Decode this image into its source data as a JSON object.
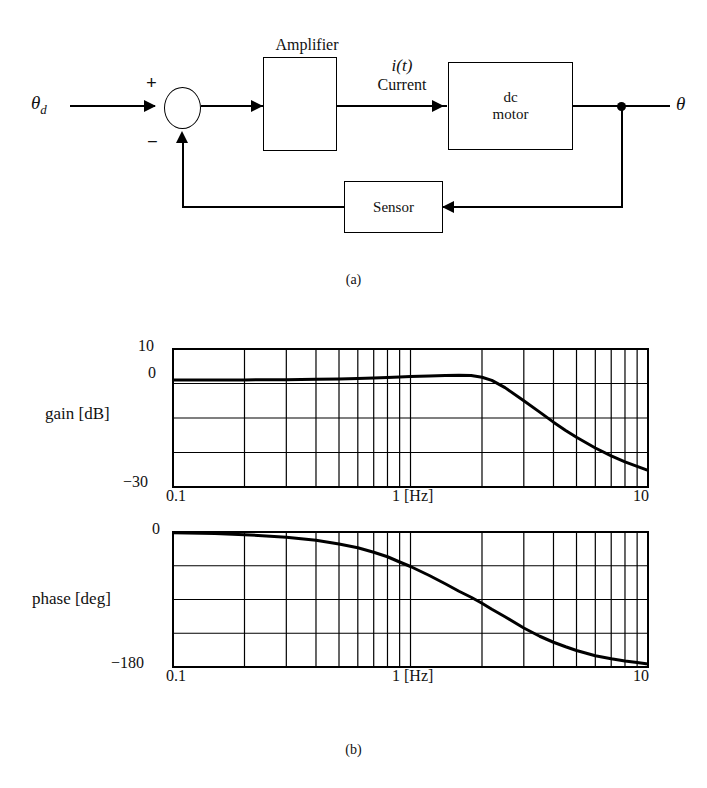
{
  "figure": {
    "part_a_caption": "(a)",
    "part_b_caption": "(b)"
  },
  "block_diagram": {
    "input_label": "θ_d",
    "input_label_base": "θ",
    "input_label_sub": "d",
    "plus_sign": "+",
    "minus_sign": "−",
    "amplifier_title": "Amplifier",
    "amplifier_box_text": "",
    "signal_label_line1": "i(t)",
    "signal_label_line2": "Current",
    "motor_line1": "dc",
    "motor_line2": "motor",
    "sensor_label": "Sensor",
    "output_label": "θ"
  },
  "chart_data": [
    {
      "type": "line",
      "id": "gain-plot",
      "title": "",
      "xlabel": "1 [Hz]",
      "ylabel": "gain [dB]",
      "xscale": "log",
      "xlim": [
        0.1,
        10
      ],
      "ylim": [
        -30,
        10
      ],
      "xticklabels": [
        "0.1",
        "1 [Hz]",
        "10"
      ],
      "yticklabels": [
        "10",
        "0",
        "-30"
      ],
      "ytick_display": [
        "10",
        "0",
        "−30"
      ],
      "grid": true,
      "y_gridlines": [
        10,
        0,
        -10,
        -20,
        -30
      ],
      "x_gridlines": [
        0.1,
        0.2,
        0.3,
        0.4,
        0.5,
        0.6,
        0.7,
        0.8,
        0.9,
        1,
        2,
        3,
        4,
        5,
        6,
        7,
        8,
        9,
        10
      ],
      "legend": "none",
      "x": [
        0.1,
        0.15,
        0.2,
        0.3,
        0.4,
        0.5,
        0.6,
        0.7,
        0.8,
        0.9,
        1.0,
        1.2,
        1.4,
        1.6,
        1.8,
        2.0,
        2.2,
        2.5,
        3.0,
        3.5,
        4.0,
        4.5,
        5.0,
        6.0,
        7.0,
        8.0,
        9.0,
        10.0
      ],
      "y": [
        1.0,
        1.0,
        1.05,
        1.1,
        1.2,
        1.3,
        1.45,
        1.6,
        1.75,
        1.9,
        2.0,
        2.2,
        2.35,
        2.4,
        2.3,
        1.8,
        0.9,
        -1.2,
        -5.0,
        -8.3,
        -11.2,
        -13.6,
        -15.6,
        -18.7,
        -21.0,
        -22.7,
        -24.0,
        -25.2
      ]
    },
    {
      "type": "line",
      "id": "phase-plot",
      "title": "",
      "xlabel": "1 [Hz]",
      "ylabel": "phase [deg]",
      "xscale": "log",
      "xlim": [
        0.1,
        10
      ],
      "ylim": [
        -180,
        0
      ],
      "xticklabels": [
        "0.1",
        "1 [Hz]",
        "10"
      ],
      "yticklabels": [
        "0",
        "-180"
      ],
      "ytick_display": [
        "0",
        "−180"
      ],
      "grid": true,
      "y_gridlines": [
        0,
        -45,
        -90,
        -135,
        -180
      ],
      "x_gridlines": [
        0.1,
        0.2,
        0.3,
        0.4,
        0.5,
        0.6,
        0.7,
        0.8,
        0.9,
        1,
        2,
        3,
        4,
        5,
        6,
        7,
        8,
        9,
        10
      ],
      "legend": "none",
      "x": [
        0.1,
        0.15,
        0.2,
        0.3,
        0.4,
        0.5,
        0.6,
        0.7,
        0.8,
        0.9,
        1.0,
        1.2,
        1.4,
        1.6,
        1.8,
        2.0,
        2.2,
        2.5,
        3.0,
        3.5,
        4.0,
        4.5,
        5.0,
        6.0,
        7.0,
        8.0,
        9.0,
        10.0
      ],
      "y": [
        -1,
        -2,
        -3.5,
        -7,
        -11,
        -16,
        -21,
        -27,
        -33,
        -40,
        -46,
        -58,
        -69,
        -79,
        -87,
        -95,
        -103,
        -113,
        -128,
        -139,
        -147,
        -153,
        -158,
        -165,
        -169,
        -172,
        -174,
        -176
      ]
    }
  ],
  "gain_plot": {
    "ylabel": "gain [dB]",
    "ytop": "10",
    "ymid": "0",
    "ybot": "−30",
    "xleft": "0.1",
    "xmid": "1  [Hz]",
    "xright": "10"
  },
  "phase_plot": {
    "ylabel": "phase [deg]",
    "ytop": "0",
    "ybot": "−180",
    "xleft": "0.1",
    "xmid": "1  [Hz]",
    "xright": "10"
  }
}
